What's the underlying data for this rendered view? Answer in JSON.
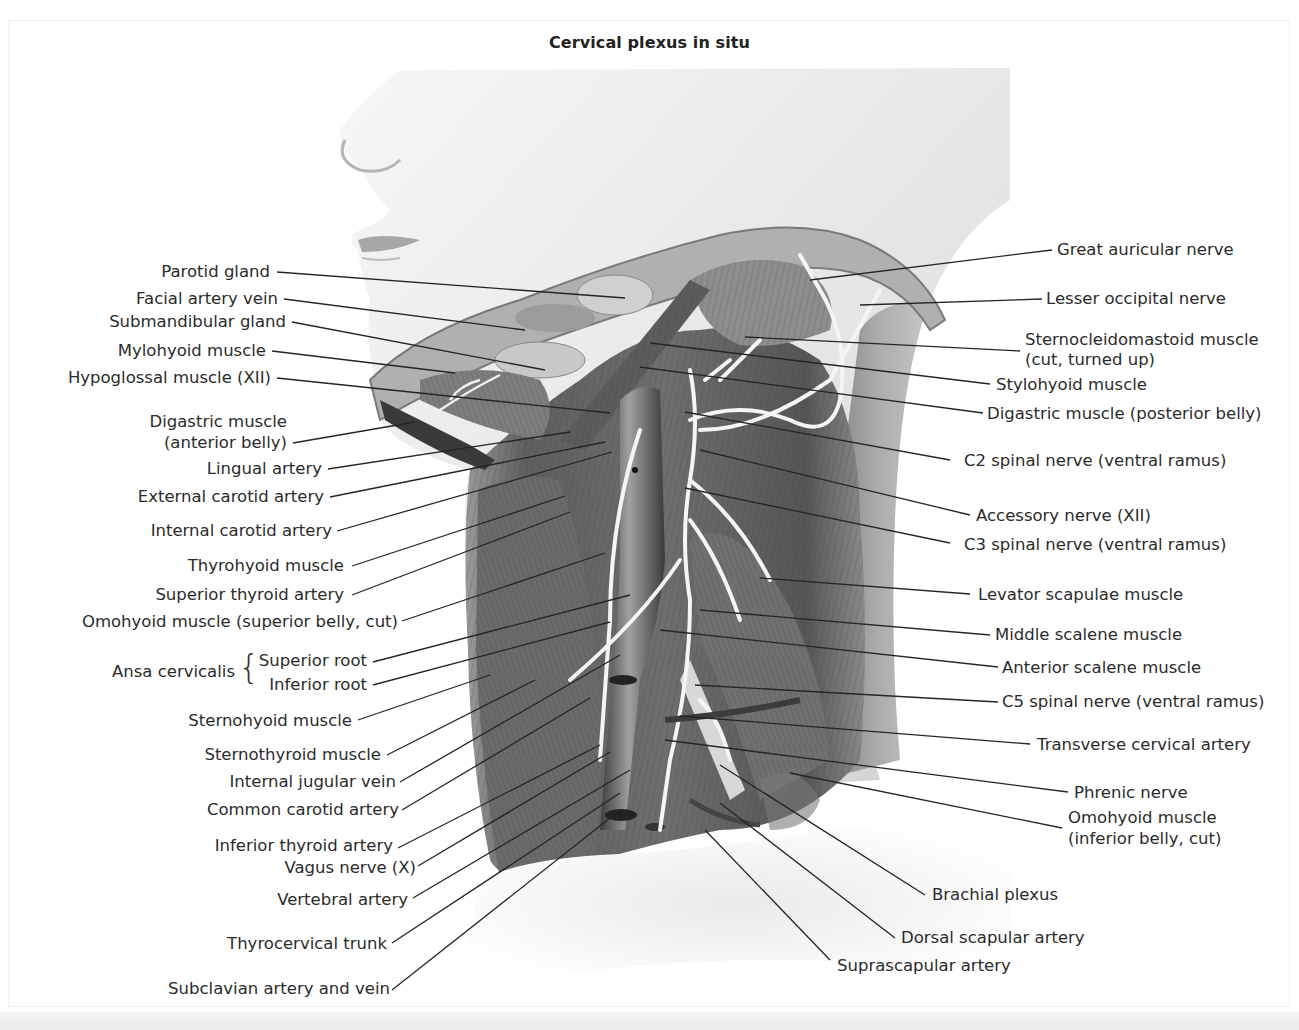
{
  "figure": {
    "title": "Cervical plexus in situ",
    "style": "grayscale anatomical illustration, lateral view of head and neck with dissected cervical region",
    "colors": {
      "background": "#ffffff",
      "text": "#2b2b2b",
      "leader_line": "#222222",
      "nerve": "#f4f4f4",
      "muscle_dark": "#4a4a4a",
      "skin": "#e6e6e6"
    }
  },
  "labels_left": [
    {
      "id": "parotid-gland",
      "text": "Parotid gland"
    },
    {
      "id": "facial-artery-vein",
      "text": "Facial artery vein"
    },
    {
      "id": "submandibular-gland",
      "text": "Submandibular gland"
    },
    {
      "id": "mylohyoid-muscle",
      "text": "Mylohyoid muscle"
    },
    {
      "id": "hypoglossal-muscle",
      "text": "Hypoglossal muscle (XII)"
    },
    {
      "id": "digastric-anterior",
      "text": "Digastric muscle",
      "text2": "(anterior belly)"
    },
    {
      "id": "lingual-artery",
      "text": "Lingual artery"
    },
    {
      "id": "external-carotid",
      "text": "External carotid artery"
    },
    {
      "id": "internal-carotid",
      "text": "Internal carotid artery"
    },
    {
      "id": "thyrohyoid-muscle",
      "text": "Thyrohyoid muscle"
    },
    {
      "id": "superior-thyroid-artery",
      "text": "Superior thyroid artery"
    },
    {
      "id": "omohyoid-superior",
      "text": "Omohyoid muscle (superior belly, cut)"
    },
    {
      "id": "superior-root",
      "text": "Superior root"
    },
    {
      "id": "inferior-root",
      "text": "Inferior root"
    },
    {
      "id": "sternohyoid-muscle",
      "text": "Sternohyoid muscle"
    },
    {
      "id": "sternothyroid-muscle",
      "text": "Sternothyroid muscle"
    },
    {
      "id": "internal-jugular-vein",
      "text": "Internal jugular vein"
    },
    {
      "id": "common-carotid",
      "text": "Common carotid artery"
    },
    {
      "id": "inferior-thyroid-artery",
      "text": "Inferior thyroid artery"
    },
    {
      "id": "vagus-nerve",
      "text": "Vagus nerve (X)"
    },
    {
      "id": "vertebral-artery",
      "text": "Vertebral artery"
    },
    {
      "id": "thyrocervical-trunk",
      "text": "Thyrocervical trunk"
    },
    {
      "id": "subclavian",
      "text": "Subclavian artery and vein"
    }
  ],
  "ansa_group": {
    "text": "Ansa cervicalis",
    "brace": "{"
  },
  "labels_right": [
    {
      "id": "great-auricular-nerve",
      "text": "Great auricular nerve"
    },
    {
      "id": "lesser-occipital-nerve",
      "text": "Lesser occipital nerve"
    },
    {
      "id": "sternocleidomastoid",
      "text": "Sternocleidomastoid muscle",
      "text2": "(cut, turned up)"
    },
    {
      "id": "stylohyoid-muscle",
      "text": "Stylohyoid muscle"
    },
    {
      "id": "digastric-posterior",
      "text": "Digastric muscle (posterior belly)"
    },
    {
      "id": "c2-spinal-nerve",
      "text": "C2 spinal nerve (ventral ramus)"
    },
    {
      "id": "accessory-nerve",
      "text": "Accessory nerve (XII)"
    },
    {
      "id": "c3-spinal-nerve",
      "text": "C3 spinal nerve (ventral ramus)"
    },
    {
      "id": "levator-scapulae",
      "text": "Levator scapulae muscle"
    },
    {
      "id": "middle-scalene",
      "text": "Middle scalene muscle"
    },
    {
      "id": "anterior-scalene",
      "text": "Anterior scalene muscle"
    },
    {
      "id": "c5-spinal-nerve",
      "text": "C5 spinal nerve (ventral ramus)"
    },
    {
      "id": "transverse-cervical-artery",
      "text": "Transverse cervical artery"
    },
    {
      "id": "phrenic-nerve",
      "text": "Phrenic nerve"
    },
    {
      "id": "omohyoid-inferior",
      "text": "Omohyoid muscle",
      "text2": "(inferior belly, cut)"
    },
    {
      "id": "brachial-plexus",
      "text": "Brachial plexus"
    },
    {
      "id": "dorsal-scapular-artery",
      "text": "Dorsal scapular artery"
    },
    {
      "id": "suprascapular-artery",
      "text": "Suprascapular artery"
    }
  ]
}
